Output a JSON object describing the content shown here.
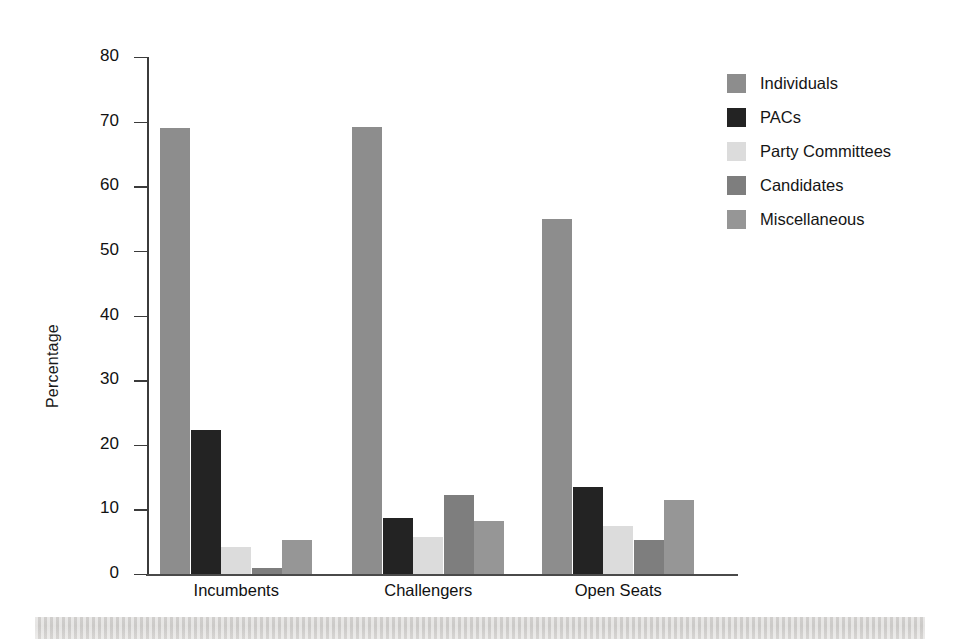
{
  "chart_data": {
    "type": "bar",
    "title": "",
    "xlabel": "",
    "ylabel": "Percentage",
    "ylim": [
      0,
      80
    ],
    "ytick_values": [
      80,
      70,
      60,
      50,
      40,
      30,
      20,
      10,
      0
    ],
    "ytick_labels": [
      "80",
      "70",
      "60",
      "50",
      "40",
      "30",
      "20",
      "10",
      "0"
    ],
    "grid": false,
    "legend_position": "right",
    "categories": [
      "Incumbents",
      "Challengers",
      "Open Seats"
    ],
    "series": [
      {
        "name": "Individuals",
        "color": "#8d8d8d",
        "values": [
          69.0,
          69.2,
          55.0
        ]
      },
      {
        "name": "PACs",
        "color": "#232323",
        "values": [
          22.3,
          8.7,
          13.4
        ]
      },
      {
        "name": "Party Committees",
        "color": "#dcdcdc",
        "values": [
          4.2,
          5.8,
          7.5
        ]
      },
      {
        "name": "Candidates",
        "color": "#7e7e7e",
        "values": [
          1.0,
          12.3,
          5.2
        ]
      },
      {
        "name": "Miscellaneous",
        "color": "#969696",
        "values": [
          5.2,
          8.2,
          11.5
        ]
      }
    ]
  },
  "legend": {
    "items": [
      {
        "label": "Individuals"
      },
      {
        "label": "PACs"
      },
      {
        "label": "Party Committees"
      },
      {
        "label": "Candidates"
      },
      {
        "label": "Miscellaneous"
      }
    ]
  },
  "axis": {
    "y_title": "Percentage",
    "y_ticks": [
      "80",
      "70",
      "60",
      "50",
      "40",
      "30",
      "20",
      "10",
      "0"
    ],
    "x_categories": [
      "Incumbents",
      "Challengers",
      "Open Seats"
    ]
  }
}
